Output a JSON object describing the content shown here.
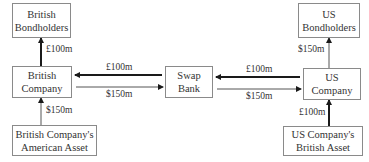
{
  "diagram": {
    "nodes": {
      "british_bondholders": {
        "line1": "British",
        "line2": "Bondholders"
      },
      "british_company": {
        "line1": "British",
        "line2": "Company"
      },
      "british_asset": {
        "line1": "British Company's",
        "line2": "American Asset"
      },
      "swap_bank": {
        "line1": "Swap",
        "line2": "Bank"
      },
      "us_bondholders": {
        "line1": "US",
        "line2": "Bondholders"
      },
      "us_company": {
        "line1": "US",
        "line2": "Company"
      },
      "us_asset": {
        "line1": "US Company's",
        "line2": "British Asset"
      }
    },
    "flows": {
      "british_company_to_bondholders": "£100m",
      "british_asset_to_company": "$150m",
      "swap_bank_to_british_company": "£100m",
      "british_company_to_swap_bank": "$150m",
      "us_company_to_swap_bank": "£100m",
      "swap_bank_to_us_company": "$150m",
      "us_company_to_bondholders": "$150m",
      "us_asset_to_company": "£100m"
    },
    "colors": {
      "arrow": "#1a1a1a",
      "thin_arrow": "#555555",
      "border": "#8a8a8a"
    }
  }
}
